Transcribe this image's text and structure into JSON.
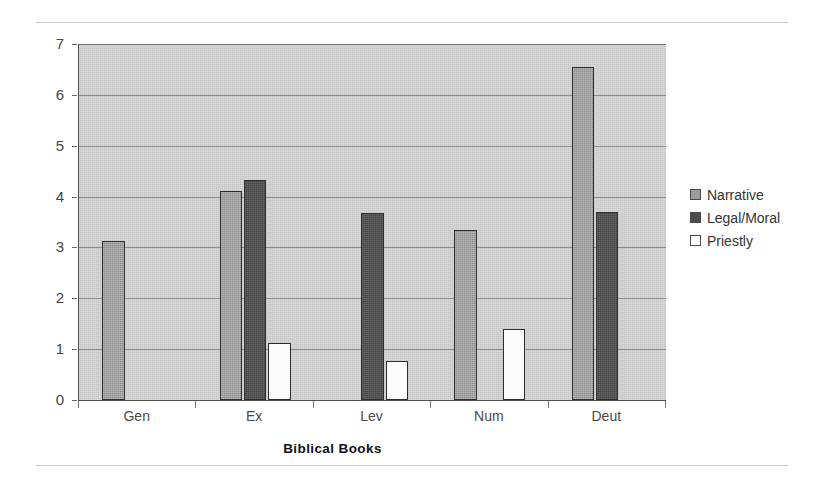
{
  "chart_data": {
    "type": "bar",
    "title": "",
    "xlabel": "Biblical Books",
    "ylabel": "Expansions per chapter",
    "categories": [
      "Gen",
      "Ex",
      "Lev",
      "Num",
      "Deut"
    ],
    "ylim": [
      0,
      7
    ],
    "ytick_labels": [
      "0",
      "1",
      "2",
      "3",
      "4",
      "5",
      "6",
      "7"
    ],
    "ytick_values": [
      0,
      1,
      2,
      3,
      4,
      5,
      6,
      7
    ],
    "grid": true,
    "legend_position": "right",
    "series": [
      {
        "name": "Narrative",
        "color": "#9c9c9c",
        "values": [
          3.13,
          4.1,
          null,
          3.35,
          6.55
        ]
      },
      {
        "name": "Legal/Moral",
        "color": "#4d4d4d",
        "values": [
          null,
          4.33,
          3.67,
          null,
          3.7
        ]
      },
      {
        "name": "Priestly",
        "color": "#ffffff",
        "values": [
          null,
          1.13,
          0.77,
          1.4,
          null
        ]
      }
    ]
  },
  "legend": {
    "items": [
      {
        "label": "Narrative",
        "swatch": "narrative"
      },
      {
        "label": "Legal/Moral",
        "swatch": "legal"
      },
      {
        "label": "Priestly",
        "swatch": "priestly"
      }
    ]
  },
  "axes": {
    "y_title": "Expansions per chapter",
    "x_title": "Biblical Books"
  },
  "colors": {
    "plot_background": "#c6c6c6",
    "narrative": "#9c9c9c",
    "legal_moral": "#4d4d4d",
    "priestly": "#ffffff",
    "axis": "#4d4d4d",
    "gridline": "#8c8c8c"
  }
}
